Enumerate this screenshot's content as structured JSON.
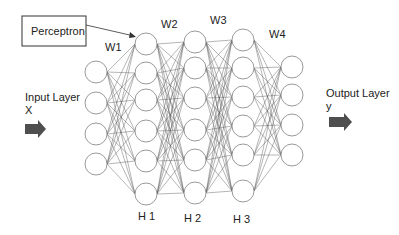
{
  "diagram": {
    "title_box": "Perceptron",
    "input_label_line1": "Input Layer",
    "input_label_line2": "X",
    "output_label_line1": "Output Layer",
    "output_label_line2": "y",
    "layers": [
      {
        "name": "input",
        "label": "",
        "nodes": 4
      },
      {
        "name": "H1",
        "label": "H 1",
        "nodes": 6
      },
      {
        "name": "H2",
        "label": "H 2",
        "nodes": 6
      },
      {
        "name": "H3",
        "label": "H 3",
        "nodes": 6
      },
      {
        "name": "output",
        "label": "",
        "nodes": 4
      }
    ],
    "weights": [
      "W1",
      "W2",
      "W3",
      "W4"
    ],
    "colors": {
      "node_stroke": "#9a9a9a",
      "edge": "#555555",
      "arrow": "#4f4f4f"
    }
  }
}
